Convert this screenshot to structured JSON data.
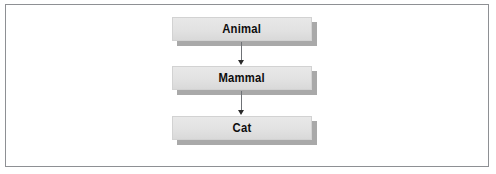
{
  "figure": {
    "type": "class-hierarchy-diagram",
    "border_color": "#8e9094",
    "background_color": "#ffffff"
  },
  "nodes": [
    {
      "id": "animal",
      "label": "Animal",
      "fill_color": "#e2e2e2",
      "text_color": "#0d0d0d",
      "shadow_color": "#a9a9a9"
    },
    {
      "id": "mammal",
      "label": "Mammal",
      "fill_color": "#e2e2e2",
      "text_color": "#0d0d0d",
      "shadow_color": "#a9a9a9"
    },
    {
      "id": "cat",
      "label": "Cat",
      "fill_color": "#e2e2e2",
      "text_color": "#0d0d0d",
      "shadow_color": "#a9a9a9"
    }
  ],
  "connectors": [
    {
      "id": "animal-to-mammal",
      "from": "Animal",
      "to": "Mammal",
      "direction": "down",
      "line_color": "#6f7276",
      "head_color": "#2b2b2b"
    },
    {
      "id": "mammal-to-cat",
      "from": "Mammal",
      "to": "Cat",
      "direction": "down",
      "line_color": "#6f7276",
      "head_color": "#2b2b2b"
    }
  ]
}
